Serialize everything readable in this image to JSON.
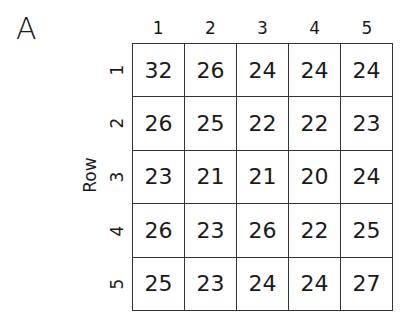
{
  "panel_label": "A",
  "chart_data": {
    "type": "table",
    "title": "",
    "ylabel": "Row",
    "xlabel": "",
    "columns": [
      "1",
      "2",
      "3",
      "4",
      "5"
    ],
    "rows": [
      "1",
      "2",
      "3",
      "4",
      "5"
    ],
    "values": [
      [
        32,
        26,
        24,
        24,
        24
      ],
      [
        26,
        25,
        22,
        22,
        23
      ],
      [
        23,
        21,
        21,
        20,
        24
      ],
      [
        26,
        23,
        26,
        22,
        25
      ],
      [
        25,
        23,
        24,
        24,
        27
      ]
    ],
    "grid": true
  }
}
